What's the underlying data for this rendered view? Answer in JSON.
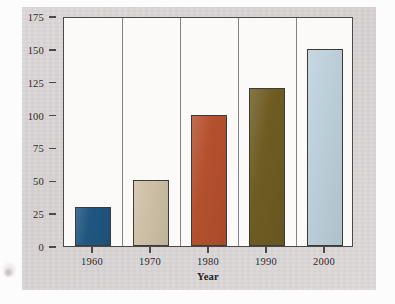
{
  "chart_data": {
    "type": "bar",
    "title": "",
    "categories": [
      "1960",
      "1970",
      "1980",
      "1990",
      "2000"
    ],
    "values": [
      30,
      50,
      100,
      120,
      150
    ],
    "series": [
      {
        "name": "Billions of dollars",
        "values": [
          30,
          50,
          100,
          120,
          150
        ]
      }
    ],
    "xlabel": "Year",
    "ylabel": "Billions of dollars",
    "ylim": [
      0,
      175
    ],
    "yticks": [
      0,
      25,
      50,
      75,
      100,
      125,
      150,
      175
    ],
    "ytick_labels": [
      "0",
      "25",
      "50",
      "75",
      "100",
      "125",
      "150",
      "175"
    ],
    "grid": false,
    "legend": false,
    "bar_colors": [
      "#1f5680",
      "#cdc0a6",
      "#b4502e",
      "#6e5c22",
      "#bcd0da"
    ],
    "colors": {
      "panel_background": "#d8d2d3",
      "plot_background": "#fbfaf8",
      "axis_line": "#4a4a4a",
      "bar_outline": "#3b3b39",
      "text": "#2b2b2b"
    }
  }
}
